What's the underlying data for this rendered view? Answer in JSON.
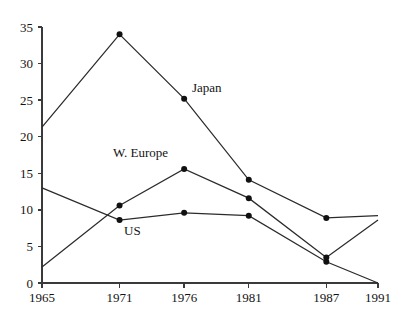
{
  "chart_data": {
    "type": "line",
    "title": "",
    "subtitle": "",
    "xlabel": "",
    "ylabel": "",
    "x": [
      1965,
      1971,
      1976,
      1981,
      1987,
      1991
    ],
    "categories": [
      "1965",
      "1971",
      "1976",
      "1981",
      "1987",
      "1991"
    ],
    "xtick_labels": [
      "1965",
      "1971",
      "1976",
      "1981",
      "1987",
      "1991"
    ],
    "ytick_labels": [
      "0",
      "5",
      "10",
      "15",
      "20",
      "25",
      "30",
      "35"
    ],
    "yticks": [
      0,
      5,
      10,
      15,
      20,
      25,
      30,
      35
    ],
    "xlim": [
      1965,
      1991
    ],
    "ylim": [
      0,
      35
    ],
    "grid": false,
    "legend": "inline-annotations",
    "markers": "filled-circle",
    "series": [
      {
        "name": "Japan",
        "label": "Japan",
        "color": "#2b2b2b",
        "values": [
          21.3,
          34.0,
          25.2,
          14.1,
          8.9,
          9.2
        ],
        "markers_at": [
          1971,
          1976,
          1981,
          1987
        ]
      },
      {
        "name": "W. Europe",
        "label": "W. Europe",
        "color": "#2b2b2b",
        "values": [
          2.2,
          10.6,
          15.6,
          11.6,
          3.5,
          8.6
        ],
        "markers_at": [
          1971,
          1976,
          1981,
          1987
        ]
      },
      {
        "name": "US",
        "label": "US",
        "color": "#2b2b2b",
        "values": [
          13.0,
          8.6,
          9.6,
          9.2,
          2.9,
          0.0
        ],
        "markers_at": [
          1971,
          1976,
          1981,
          1987
        ]
      }
    ],
    "annotations": [
      {
        "text": "Japan",
        "x_px": 192,
        "y_px": 92,
        "series": "Japan"
      },
      {
        "text": "W. Europe",
        "x_px": 113,
        "y_px": 157,
        "series": "W. Europe"
      },
      {
        "text": "US",
        "x_px": 124,
        "y_px": 235,
        "series": "US"
      }
    ]
  },
  "axes": {
    "y_axis_name": "y-axis",
    "x_axis_name": "x-axis",
    "tick_color": "#3a3a3a"
  }
}
